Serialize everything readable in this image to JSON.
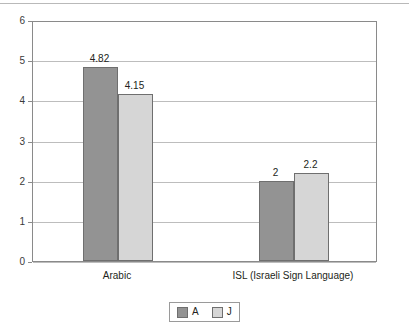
{
  "chart_data": {
    "type": "bar",
    "title": "",
    "subtitle": "",
    "xlabel": "",
    "ylabel": "",
    "ylim": [
      0,
      6
    ],
    "yticks": [
      "0",
      "1",
      "2",
      "3",
      "4",
      "5",
      "6"
    ],
    "grid": true,
    "legend_position": "bottom",
    "categories": [
      "Arabic",
      "ISL (Israeli Sign Language)"
    ],
    "series": [
      {
        "name": "A",
        "color": "#939393",
        "values": [
          4.82,
          2
        ],
        "labels": [
          "4.82",
          "2"
        ]
      },
      {
        "name": "J",
        "color": "#d6d6d6",
        "values": [
          4.15,
          2.2
        ],
        "labels": [
          "4.15",
          "2.2"
        ]
      }
    ]
  },
  "legend": {
    "entries": [
      {
        "label": "A",
        "swatch": "series-a"
      },
      {
        "label": "J",
        "swatch": "series-j"
      }
    ]
  },
  "colors": {
    "series_a": "#939393",
    "series_j": "#d6d6d6",
    "axis": "#8a8a8a",
    "grid": "#bdbdbd",
    "text": "#231f20"
  }
}
